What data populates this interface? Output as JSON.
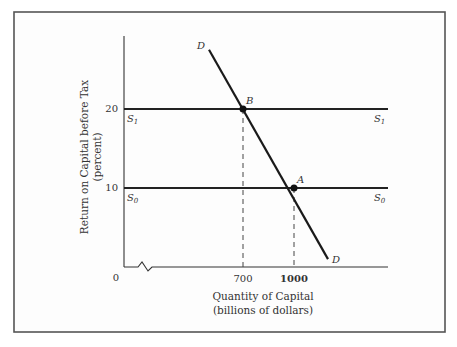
{
  "chart_data": {
    "type": "line",
    "title": "",
    "xlabel": "Quantity of Capital",
    "xlabel_sub": "(billions of dollars)",
    "ylabel": "Return on Capital before Tax",
    "ylabel_sub": "(percent)",
    "xlim": [
      0,
      1500
    ],
    "ylim": [
      0,
      25
    ],
    "axis_break_x": true,
    "origin_label": "0",
    "x_ticks": [
      {
        "value": 700,
        "label": "700"
      },
      {
        "value": 1000,
        "label": "1000"
      }
    ],
    "y_ticks": [
      {
        "value": 10,
        "label": "10"
      },
      {
        "value": 20,
        "label": "20"
      }
    ],
    "series": [
      {
        "name": "S1",
        "label_main": "S",
        "label_sub": "1",
        "type": "horizontal",
        "y": 20,
        "x_range": [
          0,
          1250
        ]
      },
      {
        "name": "S0",
        "label_main": "S",
        "label_sub": "0",
        "type": "horizontal",
        "y": 10,
        "x_range": [
          0,
          1250
        ]
      },
      {
        "name": "D",
        "label": "D",
        "type": "line",
        "points": [
          [
            500,
            27.5
          ],
          [
            1200,
            1.0
          ]
        ]
      }
    ],
    "points": [
      {
        "name": "B",
        "label": "B",
        "x": 700,
        "y": 20
      },
      {
        "name": "A",
        "label": "A",
        "x": 1000,
        "y": 10
      }
    ],
    "guides": [
      {
        "from_point": "B",
        "to_axis": "x",
        "style": "dashed"
      },
      {
        "from_point": "A",
        "to_axis": "x",
        "style": "dashed"
      }
    ],
    "grid": false,
    "legend": "none"
  }
}
